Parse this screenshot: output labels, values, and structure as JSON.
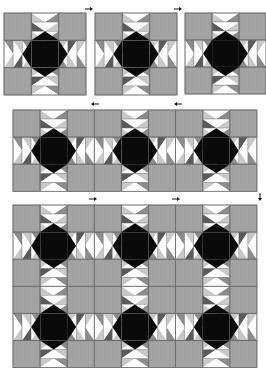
{
  "diagram": {
    "type": "quilt-assembly-diagram",
    "colors": {
      "background": "#ffffff",
      "square_fill": "#a4a4a4",
      "square_texture": "#9a9a9a",
      "seam": "#6e6e6e",
      "star": "#0a0a0a",
      "goose_white": "#ffffff",
      "goose_light": "#c8c8c8",
      "goose_mid": "#8c8c8c",
      "goose_dark": "#5a5a5a",
      "arrow": "#111111"
    },
    "block": {
      "grid": "3x3",
      "geese_per_arm": 3,
      "center": "eight-point-star"
    },
    "steps": [
      {
        "id": "step-1-blocks",
        "label": "Individual blocks",
        "blocks": [
          {
            "x": 4,
            "y": 13,
            "size": 82
          },
          {
            "x": 95,
            "y": 13,
            "size": 82
          },
          {
            "x": 185,
            "y": 13,
            "size": 81
          }
        ],
        "arrows": [
          {
            "x": 90,
            "y": 9,
            "dir": "right"
          },
          {
            "x": 179,
            "y": 9,
            "dir": "right"
          }
        ]
      },
      {
        "id": "step-2-row",
        "label": "Blocks joined into a row",
        "row": {
          "x": 13,
          "y": 110,
          "cols": 3,
          "rows": 1,
          "size": 81.3
        },
        "arrows": [
          {
            "x": 94,
            "y": 104,
            "dir": "left"
          },
          {
            "x": 177,
            "y": 104,
            "dir": "left"
          }
        ]
      },
      {
        "id": "step-3-top",
        "label": "Rows joined into quilt top",
        "row": {
          "x": 13,
          "y": 205,
          "cols": 3,
          "rows": 2,
          "size": 81.3
        },
        "arrows": [
          {
            "x": 94,
            "y": 199,
            "dir": "right"
          },
          {
            "x": 177,
            "y": 199,
            "dir": "right"
          },
          {
            "x": 260,
            "y": 198,
            "dir": "down"
          }
        ]
      }
    ]
  }
}
